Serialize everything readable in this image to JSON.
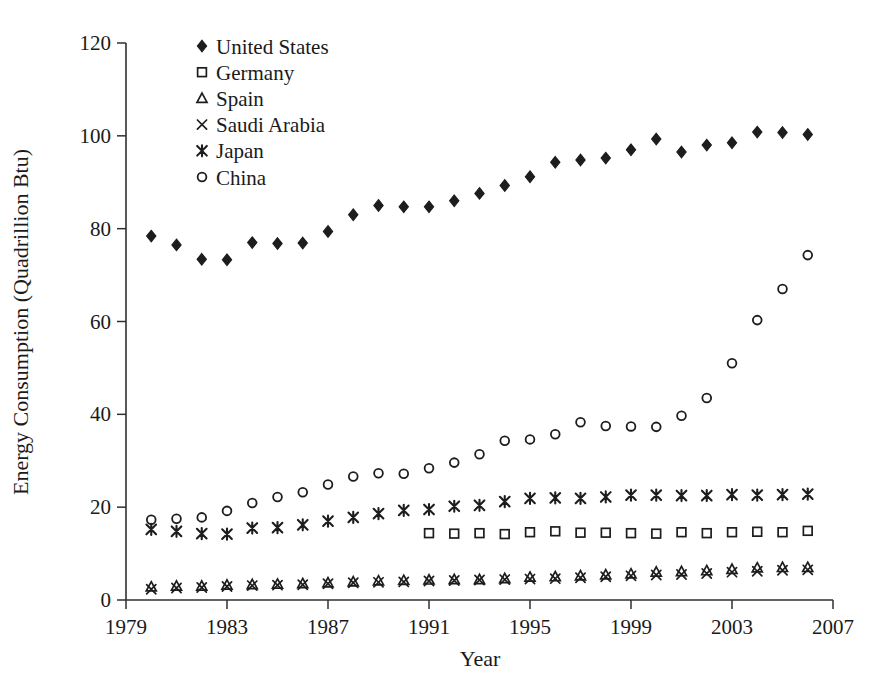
{
  "chart_data": {
    "type": "scatter",
    "title": "",
    "xlabel": "Year",
    "ylabel": "Energy Consumption (Quadrillion Btu)",
    "xlim": [
      1979,
      2007
    ],
    "ylim": [
      0,
      120
    ],
    "xticks": [
      1979,
      1983,
      1987,
      1991,
      1995,
      1999,
      2003,
      2007
    ],
    "yticks": [
      0,
      20,
      40,
      60,
      80,
      100,
      120
    ],
    "grid": false,
    "legend_position": "top-left-inside",
    "x": [
      1980,
      1981,
      1982,
      1983,
      1984,
      1985,
      1986,
      1987,
      1988,
      1989,
      1990,
      1991,
      1992,
      1993,
      1994,
      1995,
      1996,
      1997,
      1998,
      1999,
      2000,
      2001,
      2002,
      2003,
      2004,
      2005,
      2006
    ],
    "series": [
      {
        "name": "United States",
        "marker": "filled-diamond",
        "values": [
          78.4,
          76.5,
          73.4,
          73.3,
          77.0,
          76.8,
          76.9,
          79.4,
          83.0,
          85.0,
          84.7,
          84.7,
          86.0,
          87.6,
          89.3,
          91.2,
          94.3,
          94.8,
          95.2,
          97.0,
          99.3,
          96.5,
          98.0,
          98.5,
          100.8,
          100.7,
          100.3
        ]
      },
      {
        "name": "Germany",
        "marker": "open-square",
        "values": [
          null,
          null,
          null,
          null,
          null,
          null,
          null,
          null,
          null,
          null,
          null,
          14.4,
          14.3,
          14.4,
          14.2,
          14.6,
          14.8,
          14.5,
          14.5,
          14.4,
          14.3,
          14.6,
          14.4,
          14.6,
          14.7,
          14.6,
          14.9
        ]
      },
      {
        "name": "Spain",
        "marker": "open-triangle",
        "values": [
          2.8,
          3.0,
          3.0,
          3.2,
          3.3,
          3.4,
          3.5,
          3.7,
          3.9,
          4.1,
          4.2,
          4.3,
          4.4,
          4.4,
          4.6,
          4.9,
          5.0,
          5.2,
          5.4,
          5.6,
          6.0,
          6.1,
          6.3,
          6.6,
          6.9,
          7.0,
          7.0
        ]
      },
      {
        "name": "Saudi Arabia",
        "marker": "cross-x",
        "values": [
          2.3,
          2.6,
          2.7,
          2.9,
          3.1,
          3.2,
          3.3,
          3.5,
          3.7,
          3.8,
          3.9,
          4.1,
          4.2,
          4.3,
          4.4,
          4.5,
          4.6,
          4.8,
          5.0,
          5.2,
          5.4,
          5.5,
          5.7,
          6.0,
          6.2,
          6.4,
          6.5
        ]
      },
      {
        "name": "Japan",
        "marker": "asterisk",
        "values": [
          15.2,
          14.8,
          14.3,
          14.2,
          15.5,
          15.6,
          16.2,
          17.0,
          17.8,
          18.6,
          19.3,
          19.5,
          20.2,
          20.4,
          21.2,
          21.9,
          22.0,
          21.9,
          22.2,
          22.6,
          22.6,
          22.5,
          22.5,
          22.7,
          22.6,
          22.7,
          22.8
        ]
      },
      {
        "name": "China",
        "marker": "open-circle",
        "values": [
          17.3,
          17.5,
          17.8,
          19.2,
          20.9,
          22.2,
          23.2,
          24.9,
          26.6,
          27.3,
          27.2,
          28.4,
          29.6,
          31.4,
          34.3,
          34.6,
          35.7,
          38.3,
          37.5,
          37.4,
          37.3,
          39.7,
          43.5,
          51.0,
          60.3,
          67.0,
          74.3
        ]
      }
    ]
  },
  "legend": {
    "items": [
      {
        "label": "United States",
        "marker": "filled-diamond"
      },
      {
        "label": "Germany",
        "marker": "open-square"
      },
      {
        "label": "Spain",
        "marker": "open-triangle"
      },
      {
        "label": "Saudi Arabia",
        "marker": "cross-x"
      },
      {
        "label": "Japan",
        "marker": "asterisk"
      },
      {
        "label": "China",
        "marker": "open-circle"
      }
    ]
  },
  "axes": {
    "x_title": "Year",
    "y_title": "Energy Consumption (Quadrillion Btu)",
    "x_tick_labels": [
      "1979",
      "1983",
      "1987",
      "1991",
      "1995",
      "1999",
      "2003",
      "2007"
    ],
    "y_tick_labels": [
      "0",
      "20",
      "40",
      "60",
      "80",
      "100",
      "120"
    ]
  },
  "colors": {
    "marker": "#1d1d1d",
    "axis": "#303030",
    "background": "#ffffff",
    "text": "#1a1a1a"
  }
}
